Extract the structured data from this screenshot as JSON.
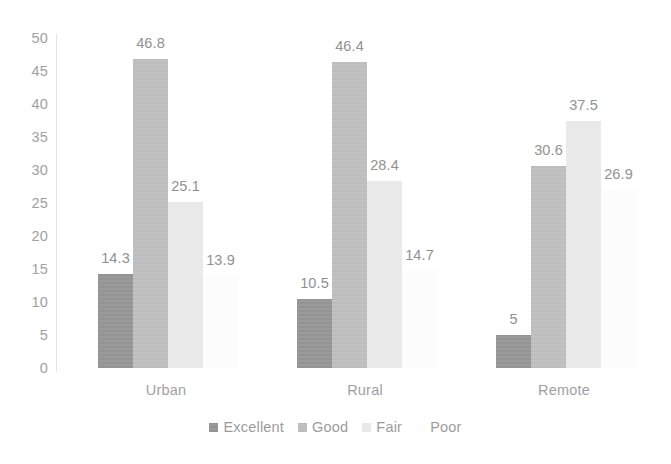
{
  "chart_data": {
    "type": "bar",
    "title": "",
    "subtitle": "",
    "xlabel": "",
    "ylabel": "",
    "categories": [
      "Urban",
      "Rural",
      "Remote"
    ],
    "series": [
      {
        "name": "Excellent",
        "color": "#949494",
        "values": [
          14.3,
          10.5,
          5
        ]
      },
      {
        "name": "Good",
        "color": "#bdbdbd",
        "values": [
          46.8,
          46.4,
          30.6
        ]
      },
      {
        "name": "Fair",
        "color": "#e9e9e9",
        "values": [
          25.1,
          28.4,
          37.5
        ]
      },
      {
        "name": "Poor",
        "color": "#fcfcfc",
        "values": [
          13.9,
          14.7,
          26.9
        ]
      }
    ],
    "value_labels": [
      [
        "14.3",
        "46.8",
        "25.1",
        "13.9"
      ],
      [
        "10.5",
        "46.4",
        "28.4",
        "14.7"
      ],
      [
        "5",
        "30.6",
        "37.5",
        "26.9"
      ]
    ],
    "ylim": [
      0,
      50
    ],
    "y_ticks": [
      "0",
      "5",
      "10",
      "15",
      "20",
      "25",
      "30",
      "35",
      "40",
      "45",
      "50"
    ],
    "grid": false,
    "legend_position": "bottom",
    "axis_color": "#e3e3e3",
    "text_color": "#9a9a9a"
  },
  "legend": {
    "items": [
      {
        "label": "Excellent",
        "color": "#949494"
      },
      {
        "label": "Good",
        "color": "#bdbdbd"
      },
      {
        "label": "Fair",
        "color": "#e9e9e9"
      },
      {
        "label": "Poor",
        "color": "#fdfdfd"
      }
    ]
  }
}
